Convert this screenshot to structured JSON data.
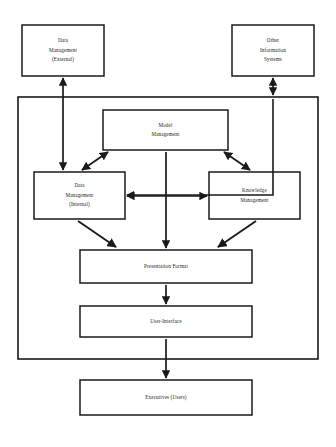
{
  "diagram": {
    "style": {
      "background": "#ffffff",
      "stroke": "#1a1a1a",
      "text": "#1a1a1a",
      "box_fill": "#ffffff"
    },
    "nodes": [
      {
        "id": "data-management-external",
        "name": "data-management-external-box",
        "lines": [
          "Data",
          "Management",
          "(External)"
        ],
        "x": 22,
        "y": 25,
        "w": 82,
        "h": 51,
        "inside_container": false
      },
      {
        "id": "other-information-systems",
        "name": "other-information-systems-box",
        "lines": [
          "Other",
          "Information",
          "Systems"
        ],
        "x": 232,
        "y": 25,
        "w": 82,
        "h": 51,
        "inside_container": false
      },
      {
        "id": "model-management",
        "name": "model-management-box",
        "lines": [
          "Model",
          "Management"
        ],
        "x": 103,
        "y": 110,
        "w": 125,
        "h": 40,
        "inside_container": true
      },
      {
        "id": "data-management-internal",
        "name": "data-management-internal-box",
        "lines": [
          "Data",
          "Management",
          "(Internal)"
        ],
        "x": 34,
        "y": 172,
        "w": 91,
        "h": 47,
        "inside_container": true
      },
      {
        "id": "knowledge-management",
        "name": "knowledge-management-box",
        "lines": [
          "Knowledge",
          "Management"
        ],
        "x": 209,
        "y": 172,
        "w": 91,
        "h": 47,
        "inside_container": true
      },
      {
        "id": "presentation-format",
        "name": "presentation-format-box",
        "lines": [
          "Presentation Format"
        ],
        "x": 80,
        "y": 250,
        "w": 172,
        "h": 33,
        "inside_container": true
      },
      {
        "id": "user-interface",
        "name": "user-interface-box",
        "lines": [
          "User-Interface"
        ],
        "x": 80,
        "y": 306,
        "w": 172,
        "h": 31,
        "inside_container": true
      },
      {
        "id": "executives-users",
        "name": "executives-users-box",
        "lines": [
          "Executives (Users)"
        ],
        "x": 80,
        "y": 380,
        "w": 172,
        "h": 35,
        "inside_container": false
      }
    ],
    "container": {
      "id": "eis-container",
      "name": "eis-system-container",
      "x": 18,
      "y": 97,
      "w": 300,
      "h": 262
    },
    "edges": [
      {
        "id": "external-to-internal",
        "name": "edge-external-to-internal",
        "from": "data-management-external",
        "to": "data-management-internal",
        "direction": "bidirectional",
        "shape": "vertical"
      },
      {
        "id": "other-systems-to-container",
        "name": "edge-other-systems-to-container",
        "from": "other-information-systems",
        "to": "eis-container",
        "direction": "bidirectional",
        "shape": "vertical"
      },
      {
        "id": "container-to-internal",
        "name": "edge-container-right-to-internal",
        "from": "eis-container",
        "to": "data-management-internal",
        "direction": "single",
        "shape": "routed"
      },
      {
        "id": "internal-to-model",
        "name": "edge-internal-to-model",
        "from": "data-management-internal",
        "to": "model-management",
        "direction": "bidirectional",
        "shape": "diagonal"
      },
      {
        "id": "model-to-knowledge",
        "name": "edge-model-to-knowledge",
        "from": "model-management",
        "to": "knowledge-management",
        "direction": "bidirectional",
        "shape": "diagonal"
      },
      {
        "id": "internal-to-knowledge",
        "name": "edge-internal-to-knowledge",
        "from": "data-management-internal",
        "to": "knowledge-management",
        "direction": "bidirectional",
        "shape": "horizontal"
      },
      {
        "id": "model-to-presentation",
        "name": "edge-model-to-presentation",
        "from": "model-management",
        "to": "presentation-format",
        "direction": "single",
        "shape": "vertical"
      },
      {
        "id": "internal-to-presentation",
        "name": "edge-internal-to-presentation",
        "from": "data-management-internal",
        "to": "presentation-format",
        "direction": "single",
        "shape": "diagonal"
      },
      {
        "id": "knowledge-to-presentation",
        "name": "edge-knowledge-to-presentation",
        "from": "knowledge-management",
        "to": "presentation-format",
        "direction": "single",
        "shape": "diagonal"
      },
      {
        "id": "presentation-to-interface",
        "name": "edge-presentation-to-interface",
        "from": "presentation-format",
        "to": "user-interface",
        "direction": "single",
        "shape": "vertical"
      },
      {
        "id": "interface-to-executives",
        "name": "edge-interface-to-executives",
        "from": "user-interface",
        "to": "executives-users",
        "direction": "single",
        "shape": "vertical"
      }
    ]
  }
}
